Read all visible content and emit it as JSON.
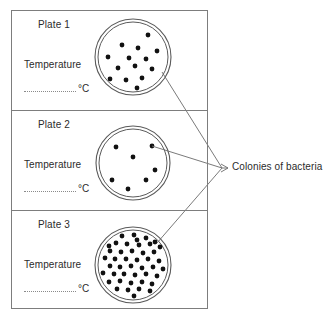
{
  "diagram": {
    "title_label": "Colonies of bacteria",
    "plates": [
      {
        "name": "Plate 1",
        "temperature_label": "Temperature",
        "temperature_value": "",
        "temperature_unit": "°C",
        "colony_count": 25,
        "colonies": [
          [
            133,
            20
          ],
          [
            110,
            34
          ],
          [
            148,
            35
          ],
          [
            165,
            41
          ],
          [
            99,
            44
          ],
          [
            122,
            45
          ],
          [
            138,
            48
          ],
          [
            157,
            51
          ],
          [
            108,
            57
          ],
          [
            129,
            58
          ],
          [
            146,
            59
          ],
          [
            168,
            57
          ],
          [
            101,
            66
          ],
          [
            118,
            68
          ],
          [
            135,
            66
          ],
          [
            152,
            69
          ],
          [
            162,
            72
          ],
          [
            110,
            79
          ],
          [
            126,
            80
          ],
          [
            142,
            78
          ],
          [
            158,
            82
          ],
          [
            120,
            90
          ],
          [
            137,
            88
          ],
          [
            152,
            91
          ],
          [
            168,
            68
          ]
        ]
      },
      {
        "name": "Plate 2",
        "temperature_label": "Temperature",
        "temperature_value": "",
        "temperature_unit": "°C",
        "colony_count": 7,
        "colonies": [
          [
            116,
            147
          ],
          [
            152,
            146
          ],
          [
            133,
            157
          ],
          [
            155,
            170
          ],
          [
            112,
            180
          ],
          [
            146,
            180
          ],
          [
            128,
            189
          ]
        ]
      },
      {
        "name": "Plate 3",
        "temperature_label": "Temperature",
        "temperature_value": "",
        "temperature_unit": "°C",
        "colony_count": 75,
        "colonies": [
          [
            128,
            228
          ],
          [
            140,
            229
          ],
          [
            152,
            231
          ],
          [
            112,
            234
          ],
          [
            122,
            236
          ],
          [
            134,
            235
          ],
          [
            146,
            238
          ],
          [
            158,
            236
          ],
          [
            166,
            240
          ],
          [
            104,
            242
          ],
          [
            116,
            243
          ],
          [
            127,
            244
          ],
          [
            139,
            245
          ],
          [
            150,
            244
          ],
          [
            160,
            247
          ],
          [
            100,
            250
          ],
          [
            110,
            251
          ],
          [
            121,
            252
          ],
          [
            132,
            251
          ],
          [
            143,
            253
          ],
          [
            154,
            252
          ],
          [
            164,
            254
          ],
          [
            171,
            250
          ],
          [
            105,
            258
          ],
          [
            115,
            259
          ],
          [
            126,
            259
          ],
          [
            137,
            260
          ],
          [
            148,
            259
          ],
          [
            159,
            261
          ],
          [
            169,
            259
          ],
          [
            99,
            265
          ],
          [
            110,
            266
          ],
          [
            120,
            267
          ],
          [
            131,
            266
          ],
          [
            142,
            268
          ],
          [
            153,
            267
          ],
          [
            163,
            269
          ],
          [
            172,
            266
          ],
          [
            103,
            273
          ],
          [
            114,
            274
          ],
          [
            124,
            274
          ],
          [
            135,
            275
          ],
          [
            146,
            274
          ],
          [
            157,
            276
          ],
          [
            167,
            274
          ],
          [
            99,
            281
          ],
          [
            109,
            282
          ],
          [
            120,
            281
          ],
          [
            131,
            283
          ],
          [
            142,
            282
          ],
          [
            152,
            284
          ],
          [
            163,
            282
          ],
          [
            171,
            279
          ],
          [
            106,
            289
          ],
          [
            117,
            289
          ],
          [
            128,
            290
          ],
          [
            139,
            289
          ],
          [
            150,
            291
          ],
          [
            160,
            289
          ],
          [
            112,
            296
          ],
          [
            123,
            297
          ],
          [
            134,
            296
          ],
          [
            145,
            298
          ],
          [
            156,
            296
          ],
          [
            120,
            302
          ],
          [
            131,
            303
          ],
          [
            142,
            302
          ],
          [
            96,
            258
          ],
          [
            96,
            272
          ],
          [
            167,
            264
          ],
          [
            104,
            234
          ],
          [
            148,
            230
          ],
          [
            118,
            226
          ],
          [
            155,
            242
          ],
          [
            109,
            246
          ],
          [
            137,
            240
          ]
        ]
      }
    ],
    "dishes": [
      {
        "cx": 133,
        "cy": 57,
        "r_outer": 38,
        "r_inner": 35
      },
      {
        "cx": 133,
        "cy": 163,
        "r_outer": 37,
        "r_inner": 34
      },
      {
        "cx": 133,
        "cy": 265,
        "r_outer": 38,
        "r_inner": 35
      }
    ],
    "leader_lines": [
      {
        "from": [
          162,
          72
        ],
        "to": [
          222,
          168
        ]
      },
      {
        "from": [
          152,
          146
        ],
        "to": [
          222,
          168
        ]
      },
      {
        "from": [
          157,
          243
        ],
        "to": [
          222,
          168
        ]
      }
    ],
    "arrow_tip": [
      228,
      168
    ],
    "colony_dot_radius": 2.4,
    "colors": {
      "frame_stroke": "#7d7d7d",
      "dish_stroke": "#5a5a5a",
      "colony_fill": "#111111",
      "leader_stroke": "#6b6b6b",
      "text": "#2b2b2b"
    }
  }
}
